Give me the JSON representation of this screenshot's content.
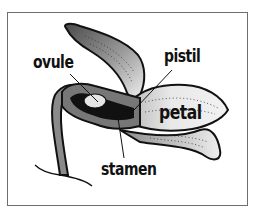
{
  "diagram": {
    "type": "labeled-illustration",
    "labels": {
      "ovule": "ovule",
      "pistil": "pistil",
      "petal": "petal",
      "stamen": "stamen"
    },
    "colors": {
      "frame": "#6e6e6e",
      "outline": "#111111",
      "dark_fill": "#555555",
      "light_fill": "#e6e6e6",
      "background": "#ffffff"
    }
  }
}
